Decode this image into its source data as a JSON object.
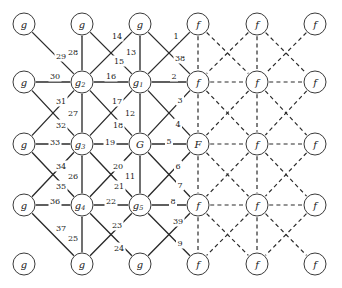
{
  "figure": {
    "name": "factor-graph-lattice",
    "width": 342,
    "height": 288,
    "edge_style_solid": "solid",
    "edge_style_dashed": "dashed",
    "stroke_color": "#2b2b2b",
    "node_fill": "#ffffff",
    "node_stroke": "#3a3a3a"
  },
  "grid": {
    "columns_x": [
      24,
      82,
      140,
      198,
      257,
      315
    ],
    "rows_y": [
      24,
      82,
      144,
      205,
      264
    ],
    "node_radius": 11
  },
  "nodes": [
    {
      "id": "n00",
      "label": "g",
      "sub": "",
      "col": 0,
      "row": 0,
      "kind": "g"
    },
    {
      "id": "n10",
      "label": "g",
      "sub": "",
      "col": 1,
      "row": 0,
      "kind": "g"
    },
    {
      "id": "n20",
      "label": "g",
      "sub": "",
      "col": 2,
      "row": 0,
      "kind": "g"
    },
    {
      "id": "n30",
      "label": "f",
      "sub": "",
      "col": 3,
      "row": 0,
      "kind": "f"
    },
    {
      "id": "n40",
      "label": "f",
      "sub": "",
      "col": 4,
      "row": 0,
      "kind": "f"
    },
    {
      "id": "n50",
      "label": "f",
      "sub": "",
      "col": 5,
      "row": 0,
      "kind": "f"
    },
    {
      "id": "n01",
      "label": "g",
      "sub": "",
      "col": 0,
      "row": 1,
      "kind": "g"
    },
    {
      "id": "n11",
      "label": "g",
      "sub": "2",
      "col": 1,
      "row": 1,
      "kind": "g"
    },
    {
      "id": "n21",
      "label": "g",
      "sub": "1",
      "col": 2,
      "row": 1,
      "kind": "g"
    },
    {
      "id": "n31",
      "label": "f",
      "sub": "",
      "col": 3,
      "row": 1,
      "kind": "f"
    },
    {
      "id": "n41",
      "label": "f",
      "sub": "",
      "col": 4,
      "row": 1,
      "kind": "f"
    },
    {
      "id": "n51",
      "label": "f",
      "sub": "",
      "col": 5,
      "row": 1,
      "kind": "f"
    },
    {
      "id": "n02",
      "label": "g",
      "sub": "",
      "col": 0,
      "row": 2,
      "kind": "g"
    },
    {
      "id": "n12",
      "label": "g",
      "sub": "3",
      "col": 1,
      "row": 2,
      "kind": "g"
    },
    {
      "id": "n22",
      "label": "G",
      "sub": "",
      "col": 2,
      "row": 2,
      "kind": "G"
    },
    {
      "id": "n32",
      "label": "F",
      "sub": "",
      "col": 3,
      "row": 2,
      "kind": "F"
    },
    {
      "id": "n42",
      "label": "f",
      "sub": "",
      "col": 4,
      "row": 2,
      "kind": "f"
    },
    {
      "id": "n52",
      "label": "f",
      "sub": "",
      "col": 5,
      "row": 2,
      "kind": "f"
    },
    {
      "id": "n03",
      "label": "g",
      "sub": "",
      "col": 0,
      "row": 3,
      "kind": "g"
    },
    {
      "id": "n13",
      "label": "g",
      "sub": "4",
      "col": 1,
      "row": 3,
      "kind": "g"
    },
    {
      "id": "n23",
      "label": "g",
      "sub": "5",
      "col": 2,
      "row": 3,
      "kind": "g"
    },
    {
      "id": "n33",
      "label": "f",
      "sub": "",
      "col": 3,
      "row": 3,
      "kind": "f"
    },
    {
      "id": "n43",
      "label": "f",
      "sub": "",
      "col": 4,
      "row": 3,
      "kind": "f"
    },
    {
      "id": "n53",
      "label": "f",
      "sub": "",
      "col": 5,
      "row": 3,
      "kind": "f"
    },
    {
      "id": "n04",
      "label": "g",
      "sub": "",
      "col": 0,
      "row": 4,
      "kind": "g"
    },
    {
      "id": "n14",
      "label": "g",
      "sub": "",
      "col": 1,
      "row": 4,
      "kind": "g"
    },
    {
      "id": "n24",
      "label": "g",
      "sub": "",
      "col": 2,
      "row": 4,
      "kind": "g"
    },
    {
      "id": "n34",
      "label": "f",
      "sub": "",
      "col": 3,
      "row": 4,
      "kind": "f"
    },
    {
      "id": "n44",
      "label": "f",
      "sub": "",
      "col": 4,
      "row": 4,
      "kind": "f"
    },
    {
      "id": "n54",
      "label": "f",
      "sub": "",
      "col": 5,
      "row": 4,
      "kind": "f"
    }
  ],
  "edges": [
    {
      "from": "n21",
      "to": "n31",
      "style": "solid",
      "label": "2",
      "lx": 174,
      "ly": 76
    },
    {
      "from": "n21",
      "to": "n30",
      "style": "solid",
      "label": "1",
      "lx": 176,
      "ly": 36
    },
    {
      "from": "n20",
      "to": "n31",
      "style": "solid",
      "label": "38",
      "lx": 180,
      "ly": 58
    },
    {
      "from": "n21",
      "to": "n32",
      "style": "solid",
      "label": "3",
      "lx": 180,
      "ly": 100
    },
    {
      "from": "n22",
      "to": "n31",
      "style": "solid",
      "label": "4",
      "lx": 178,
      "ly": 124
    },
    {
      "from": "n22",
      "to": "n32",
      "style": "solid",
      "label": "5",
      "lx": 169,
      "ly": 141
    },
    {
      "from": "n22",
      "to": "n33",
      "style": "solid",
      "label": "6",
      "lx": 178,
      "ly": 166
    },
    {
      "from": "n23",
      "to": "n32",
      "style": "solid",
      "label": "7",
      "lx": 180,
      "ly": 185
    },
    {
      "from": "n23",
      "to": "n33",
      "style": "solid",
      "label": "8",
      "lx": 173,
      "ly": 201
    },
    {
      "from": "n23",
      "to": "n34",
      "style": "solid",
      "label": "9",
      "lx": 180,
      "ly": 243
    },
    {
      "from": "n24",
      "to": "n33",
      "style": "solid",
      "label": "39",
      "lx": 178,
      "ly": 221
    },
    {
      "from": "n22",
      "to": "n23",
      "style": "solid",
      "label": "11",
      "lx": 130,
      "ly": 176
    },
    {
      "from": "n21",
      "to": "n22",
      "style": "solid",
      "label": "12",
      "lx": 130,
      "ly": 113
    },
    {
      "from": "n20",
      "to": "n21",
      "style": "solid",
      "label": "13",
      "lx": 131,
      "ly": 52
    },
    {
      "from": "n10",
      "to": "n21",
      "style": "solid",
      "label": "14",
      "lx": 117,
      "ly": 36
    },
    {
      "from": "n11",
      "to": "n20",
      "style": "solid",
      "label": "15",
      "lx": 119,
      "ly": 61
    },
    {
      "from": "n11",
      "to": "n21",
      "style": "solid",
      "label": "16",
      "lx": 111,
      "ly": 76
    },
    {
      "from": "n11",
      "to": "n22",
      "style": "solid",
      "label": "17",
      "lx": 117,
      "ly": 101
    },
    {
      "from": "n12",
      "to": "n21",
      "style": "solid",
      "label": "18",
      "lx": 118,
      "ly": 125
    },
    {
      "from": "n12",
      "to": "n22",
      "style": "solid",
      "label": "19",
      "lx": 110,
      "ly": 142
    },
    {
      "from": "n12",
      "to": "n23",
      "style": "solid",
      "label": "20",
      "lx": 118,
      "ly": 166
    },
    {
      "from": "n13",
      "to": "n22",
      "style": "solid",
      "label": "21",
      "lx": 119,
      "ly": 186
    },
    {
      "from": "n13",
      "to": "n23",
      "style": "solid",
      "label": "22",
      "lx": 111,
      "ly": 201
    },
    {
      "from": "n13",
      "to": "n24",
      "style": "solid",
      "label": "23",
      "lx": 117,
      "ly": 225
    },
    {
      "from": "n14",
      "to": "n23",
      "style": "solid",
      "label": "24",
      "lx": 119,
      "ly": 248
    },
    {
      "from": "n13",
      "to": "n14",
      "style": "solid",
      "label": "25",
      "lx": 73,
      "ly": 238
    },
    {
      "from": "n12",
      "to": "n13",
      "style": "solid",
      "label": "26",
      "lx": 73,
      "ly": 176
    },
    {
      "from": "n11",
      "to": "n12",
      "style": "solid",
      "label": "27",
      "lx": 73,
      "ly": 113
    },
    {
      "from": "n10",
      "to": "n11",
      "style": "solid",
      "label": "28",
      "lx": 73,
      "ly": 52
    },
    {
      "from": "n00",
      "to": "n11",
      "style": "solid",
      "label": "29",
      "lx": 61,
      "ly": 56
    },
    {
      "from": "n01",
      "to": "n11",
      "style": "solid",
      "label": "30",
      "lx": 55,
      "ly": 76
    },
    {
      "from": "n01",
      "to": "n12",
      "style": "solid",
      "label": "31",
      "lx": 61,
      "ly": 101
    },
    {
      "from": "n02",
      "to": "n11",
      "style": "solid",
      "label": "32",
      "lx": 61,
      "ly": 125
    },
    {
      "from": "n02",
      "to": "n12",
      "style": "solid",
      "label": "33",
      "lx": 55,
      "ly": 142
    },
    {
      "from": "n02",
      "to": "n13",
      "style": "solid",
      "label": "34",
      "lx": 61,
      "ly": 166
    },
    {
      "from": "n03",
      "to": "n12",
      "style": "solid",
      "label": "35",
      "lx": 61,
      "ly": 186
    },
    {
      "from": "n03",
      "to": "n13",
      "style": "solid",
      "label": "36",
      "lx": 55,
      "ly": 201
    },
    {
      "from": "n03",
      "to": "n14",
      "style": "solid",
      "label": "37",
      "lx": 61,
      "ly": 228
    },
    {
      "from": "n30",
      "to": "n31",
      "style": "dashed",
      "label": "",
      "lx": 0,
      "ly": 0
    },
    {
      "from": "n31",
      "to": "n32",
      "style": "dashed",
      "label": "",
      "lx": 0,
      "ly": 0
    },
    {
      "from": "n32",
      "to": "n33",
      "style": "dashed",
      "label": "",
      "lx": 0,
      "ly": 0
    },
    {
      "from": "n33",
      "to": "n34",
      "style": "dashed",
      "label": "",
      "lx": 0,
      "ly": 0
    },
    {
      "from": "n40",
      "to": "n41",
      "style": "dashed",
      "label": "",
      "lx": 0,
      "ly": 0
    },
    {
      "from": "n41",
      "to": "n42",
      "style": "dashed",
      "label": "",
      "lx": 0,
      "ly": 0
    },
    {
      "from": "n42",
      "to": "n43",
      "style": "dashed",
      "label": "",
      "lx": 0,
      "ly": 0
    },
    {
      "from": "n43",
      "to": "n44",
      "style": "dashed",
      "label": "",
      "lx": 0,
      "ly": 0
    },
    {
      "from": "n31",
      "to": "n41",
      "style": "dashed",
      "label": "",
      "lx": 0,
      "ly": 0
    },
    {
      "from": "n41",
      "to": "n51",
      "style": "dashed",
      "label": "",
      "lx": 0,
      "ly": 0
    },
    {
      "from": "n32",
      "to": "n42",
      "style": "dashed",
      "label": "",
      "lx": 0,
      "ly": 0
    },
    {
      "from": "n42",
      "to": "n52",
      "style": "dashed",
      "label": "",
      "lx": 0,
      "ly": 0
    },
    {
      "from": "n33",
      "to": "n43",
      "style": "dashed",
      "label": "",
      "lx": 0,
      "ly": 0
    },
    {
      "from": "n43",
      "to": "n53",
      "style": "dashed",
      "label": "",
      "lx": 0,
      "ly": 0
    },
    {
      "from": "n30",
      "to": "n41",
      "style": "dashed",
      "label": "",
      "lx": 0,
      "ly": 0
    },
    {
      "from": "n40",
      "to": "n31",
      "style": "dashed",
      "label": "",
      "lx": 0,
      "ly": 0
    },
    {
      "from": "n40",
      "to": "n51",
      "style": "dashed",
      "label": "",
      "lx": 0,
      "ly": 0
    },
    {
      "from": "n50",
      "to": "n41",
      "style": "dashed",
      "label": "",
      "lx": 0,
      "ly": 0
    },
    {
      "from": "n31",
      "to": "n42",
      "style": "dashed",
      "label": "",
      "lx": 0,
      "ly": 0
    },
    {
      "from": "n41",
      "to": "n32",
      "style": "dashed",
      "label": "",
      "lx": 0,
      "ly": 0
    },
    {
      "from": "n41",
      "to": "n52",
      "style": "dashed",
      "label": "",
      "lx": 0,
      "ly": 0
    },
    {
      "from": "n51",
      "to": "n42",
      "style": "dashed",
      "label": "",
      "lx": 0,
      "ly": 0
    },
    {
      "from": "n32",
      "to": "n43",
      "style": "dashed",
      "label": "",
      "lx": 0,
      "ly": 0
    },
    {
      "from": "n42",
      "to": "n33",
      "style": "dashed",
      "label": "",
      "lx": 0,
      "ly": 0
    },
    {
      "from": "n42",
      "to": "n53",
      "style": "dashed",
      "label": "",
      "lx": 0,
      "ly": 0
    },
    {
      "from": "n52",
      "to": "n43",
      "style": "dashed",
      "label": "",
      "lx": 0,
      "ly": 0
    },
    {
      "from": "n33",
      "to": "n44",
      "style": "dashed",
      "label": "",
      "lx": 0,
      "ly": 0
    },
    {
      "from": "n43",
      "to": "n34",
      "style": "dashed",
      "label": "",
      "lx": 0,
      "ly": 0
    },
    {
      "from": "n43",
      "to": "n54",
      "style": "dashed",
      "label": "",
      "lx": 0,
      "ly": 0
    },
    {
      "from": "n53",
      "to": "n44",
      "style": "dashed",
      "label": "",
      "lx": 0,
      "ly": 0
    }
  ]
}
